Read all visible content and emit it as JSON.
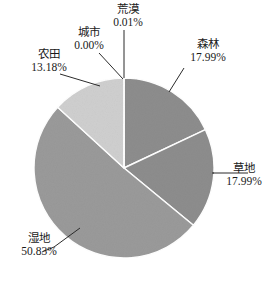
{
  "chart_data": {
    "type": "pie",
    "title": "",
    "categories": [
      "森林",
      "草地",
      "湿地",
      "农田",
      "城市",
      "荒漠"
    ],
    "values": [
      17.99,
      17.99,
      50.83,
      13.18,
      0.0,
      0.01
    ],
    "value_unit": "%",
    "labels": [
      "17.99%",
      "17.99%",
      "50.83%",
      "13.18%",
      "0.00%",
      "0.01%"
    ],
    "start_angle_deg": 0,
    "direction": "clockwise",
    "legend": "none",
    "label_placement": "outside-with-leader-lines",
    "slice_colors": [
      "#8d8d8d",
      "#8d8d8d",
      "#9a9a9a",
      "#cfcfcf",
      "#cfcfcf",
      "#8d8d8d"
    ],
    "separator_color": "#ffffff",
    "background": "#ffffff",
    "slices": [
      {
        "name": "森林",
        "label": "森林",
        "value": 17.99,
        "pct_text": "17.99%",
        "color": "#8d8d8d"
      },
      {
        "name": "草地",
        "label": "草地",
        "value": 17.99,
        "pct_text": "17.99%",
        "color": "#8d8d8d"
      },
      {
        "name": "湿地",
        "label": "湿地",
        "value": 50.83,
        "pct_text": "50.83%",
        "color": "#9a9a9a"
      },
      {
        "name": "农田",
        "label": "农田",
        "value": 13.18,
        "pct_text": "13.18%",
        "color": "#cfcfcf"
      },
      {
        "name": "城市",
        "label": "城市",
        "value": 0.0,
        "pct_text": "0.00%",
        "color": "#cfcfcf"
      },
      {
        "name": "荒漠",
        "label": "荒漠",
        "value": 0.01,
        "pct_text": "0.01%",
        "color": "#8d8d8d"
      }
    ]
  },
  "labels": {
    "forest": {
      "name": "森林",
      "pct": "17.99%"
    },
    "grass": {
      "name": "草地",
      "pct": "17.99%"
    },
    "wetland": {
      "name": "湿地",
      "pct": "50.83%"
    },
    "farmland": {
      "name": "农田",
      "pct": "13.18%"
    },
    "urban": {
      "name": "城市",
      "pct": "0.00%"
    },
    "desert": {
      "name": "荒漠",
      "pct": "0.01%"
    }
  }
}
